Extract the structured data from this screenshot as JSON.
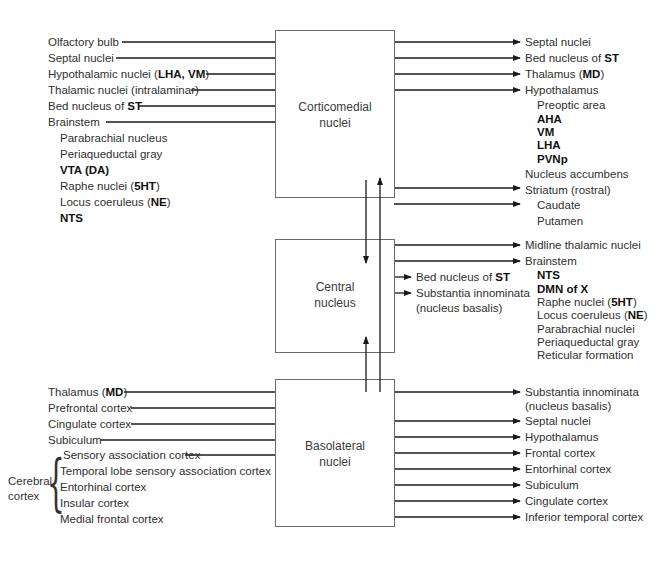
{
  "boxes": {
    "corticomedial": {
      "line1": "Corticomedial",
      "line2": "nuclei"
    },
    "central": {
      "line1": "Central",
      "line2": "nucleus"
    },
    "basolateral": {
      "line1": "Basolateral",
      "line2": "nuclei"
    }
  },
  "corticomedial_inputs": [
    {
      "text": "Olfactory bulb",
      "bold": ""
    },
    {
      "text": "Septal nuclei",
      "bold": ""
    },
    {
      "pre": "Hypothalamic nuclei (",
      "bold": "LHA, VM",
      "post": ")"
    },
    {
      "text": "Thalamic nuclei (intralaminar)",
      "bold": ""
    },
    {
      "pre": "Bed nucleus of ",
      "bold": "ST",
      "post": ""
    },
    {
      "text": "Brainstem",
      "bold": ""
    }
  ],
  "brainstem_inputs": [
    {
      "pre": "Parabrachial nucleus",
      "bold": "",
      "post": ""
    },
    {
      "pre": "Periaqueductal gray",
      "bold": "",
      "post": ""
    },
    {
      "pre": "",
      "bold": "VTA (DA)",
      "post": ""
    },
    {
      "pre": "Raphe nuclei (",
      "bold": "5HT",
      "post": ")"
    },
    {
      "pre": "Locus coeruleus (",
      "bold": "NE",
      "post": ")"
    },
    {
      "pre": "",
      "bold": "NTS",
      "post": ""
    }
  ],
  "corticomedial_outputs": [
    {
      "pre": "Septal nuclei",
      "bold": "",
      "post": ""
    },
    {
      "pre": "Bed nucleus of ",
      "bold": "ST",
      "post": ""
    },
    {
      "pre": "Thalamus (",
      "bold": "MD",
      "post": ")"
    },
    {
      "pre": "Hypothalamus",
      "bold": "",
      "post": ""
    }
  ],
  "hypothalamus_targets": [
    {
      "pre": "Preoptic area",
      "bold": ""
    },
    {
      "pre": "",
      "bold": "AHA"
    },
    {
      "pre": "",
      "bold": "VM"
    },
    {
      "pre": "",
      "bold": "LHA"
    },
    {
      "pre": "",
      "bold": "PVNp"
    }
  ],
  "corticomedial_outputs_2": [
    {
      "text": "Nucleus accumbens"
    },
    {
      "text": "Striatum (rostral)"
    }
  ],
  "striatum_targets": [
    "Caudate",
    "Putamen"
  ],
  "central_outputs": [
    {
      "text": "Midline thalamic nuclei"
    },
    {
      "text": "Brainstem"
    }
  ],
  "central_brainstem_targets": [
    {
      "pre": "",
      "bold": "NTS",
      "post": ""
    },
    {
      "pre": "",
      "bold": "DMN of X",
      "post": ""
    },
    {
      "pre": "Raphe nuclei (",
      "bold": "5HT",
      "post": ")"
    },
    {
      "pre": "Locus coeruleus (",
      "bold": "NE",
      "post": ")"
    },
    {
      "pre": "Parabrachial nuclei",
      "bold": "",
      "post": ""
    },
    {
      "pre": "Periaqueductal gray",
      "bold": "",
      "post": ""
    },
    {
      "pre": "Reticular formation",
      "bold": "",
      "post": ""
    }
  ],
  "central_side_outputs": [
    {
      "pre": "Bed nucleus of ",
      "bold": "ST"
    },
    {
      "pre": "Substantia innominata",
      "bold": ""
    },
    {
      "pre": "(nucleus basalis)",
      "bold": ""
    }
  ],
  "basolateral_inputs": [
    {
      "pre": "Thalamus (",
      "bold": "MD",
      "post": ")"
    },
    {
      "pre": "Prefrontal cortex",
      "bold": "",
      "post": ""
    },
    {
      "pre": "Cingulate cortex",
      "bold": "",
      "post": ""
    },
    {
      "pre": "Subiculum",
      "bold": "",
      "post": ""
    }
  ],
  "cerebral_cortex": {
    "label_line1": "Cerebral",
    "label_line2": "cortex",
    "items": [
      "Sensory association cortex",
      "Temporal lobe sensory association cortex",
      "Entorhinal cortex",
      "Insular cortex",
      "Medial frontal cortex"
    ]
  },
  "basolateral_outputs": [
    "Substantia innominata",
    "(nucleus basalis)",
    "Septal nuclei",
    "Hypothalamus",
    "Frontal cortex",
    "Entorhinal cortex",
    "Subiculum",
    "Cingulate cortex",
    "Inferior temporal cortex"
  ],
  "colors": {
    "line": "#1a1a1a",
    "box_border": "#6a6a6a",
    "text": "#2f2f2f"
  }
}
